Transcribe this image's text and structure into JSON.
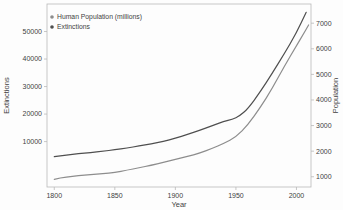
{
  "figure": {
    "background": "#fdfdfd",
    "frame_color": "#b9b9b9",
    "tick_text_color": "#3f3f3f",
    "legend": {
      "items": [
        {
          "label": "Human Population (millions)",
          "marker": "filled-circle",
          "color": "#8d8d8d"
        },
        {
          "label": "Extinctions",
          "marker": "filled-circle",
          "color": "#4f4f4f"
        }
      ]
    }
  },
  "chart_data": {
    "type": "line",
    "title": "",
    "xlabel": "Year",
    "ylabel_left": "Extinctions",
    "ylabel_right": "Population",
    "x_ticks": [
      1800,
      1850,
      1900,
      1950,
      2000
    ],
    "left_ticks": [
      10000,
      20000,
      30000,
      40000,
      50000
    ],
    "right_ticks": [
      1000,
      2000,
      3000,
      4000,
      5000,
      6000,
      7000
    ],
    "xlim": [
      1794,
      2012
    ],
    "left_ylim": [
      -6500,
      60000
    ],
    "right_ylim": [
      600,
      7750
    ],
    "grid": false,
    "legend_position": "top-left-inside",
    "series": [
      {
        "name": "Extinctions",
        "axis": "left",
        "color": "#4f4f4f",
        "points": [
          [
            1800,
            4500
          ],
          [
            1810,
            5100
          ],
          [
            1820,
            5600
          ],
          [
            1830,
            6000
          ],
          [
            1840,
            6500
          ],
          [
            1850,
            7000
          ],
          [
            1860,
            7700
          ],
          [
            1870,
            8400
          ],
          [
            1880,
            9200
          ],
          [
            1890,
            10100
          ],
          [
            1900,
            11200
          ],
          [
            1910,
            12600
          ],
          [
            1920,
            14100
          ],
          [
            1930,
            15700
          ],
          [
            1940,
            17400
          ],
          [
            1947,
            18100
          ],
          [
            1953,
            19300
          ],
          [
            1960,
            22000
          ],
          [
            1970,
            28000
          ],
          [
            1980,
            34800
          ],
          [
            1990,
            42000
          ],
          [
            2000,
            49500
          ],
          [
            2008,
            57000
          ]
        ]
      },
      {
        "name": "Human Population (millions)",
        "axis": "right",
        "color": "#8d8d8d",
        "points": [
          [
            1800,
            900
          ],
          [
            1810,
            1000
          ],
          [
            1820,
            1040
          ],
          [
            1830,
            1080
          ],
          [
            1840,
            1120
          ],
          [
            1850,
            1170
          ],
          [
            1860,
            1260
          ],
          [
            1870,
            1350
          ],
          [
            1880,
            1450
          ],
          [
            1890,
            1560
          ],
          [
            1900,
            1680
          ],
          [
            1910,
            1800
          ],
          [
            1920,
            1920
          ],
          [
            1930,
            2100
          ],
          [
            1940,
            2300
          ],
          [
            1950,
            2550
          ],
          [
            1960,
            3030
          ],
          [
            1970,
            3700
          ],
          [
            1980,
            4450
          ],
          [
            1990,
            5320
          ],
          [
            2000,
            6120
          ],
          [
            2005,
            6520
          ],
          [
            2010,
            6930
          ]
        ]
      }
    ]
  }
}
